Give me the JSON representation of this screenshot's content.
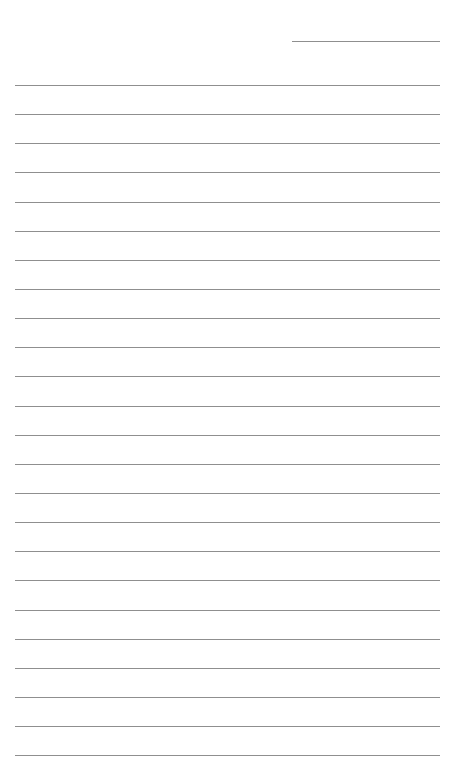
{
  "page": {
    "type": "lined-writing-paper",
    "line_color": "#8f8f8f",
    "background": "#ffffff"
  },
  "header": {
    "date_value": ""
  },
  "ruled_lines": {
    "count": 24,
    "contents": [
      "",
      "",
      "",
      "",
      "",
      "",
      "",
      "",
      "",
      "",
      "",
      "",
      "",
      "",
      "",
      "",
      "",
      "",
      "",
      "",
      "",
      "",
      "",
      ""
    ]
  }
}
